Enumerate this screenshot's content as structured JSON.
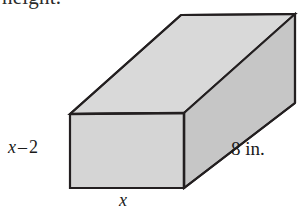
{
  "figure": {
    "kind": "rectangular-prism",
    "cutoff_text_top": "height.",
    "labels": {
      "height_left": {
        "variable": "x",
        "operator": "–",
        "value": "2",
        "full": "x – 2"
      },
      "width_bottom": "x",
      "depth_right": "8 in."
    },
    "colors": {
      "background": "#ffffff",
      "front_face": "#d5d5d5",
      "top_face": "#d9d9d9",
      "right_face": "#c6c6c6",
      "edge_stroke": "#231f20",
      "text": "#1a1a1a"
    },
    "geometry": {
      "front_face": {
        "top_left": [
          70,
          114
        ],
        "top_right": [
          184,
          113
        ],
        "bottom_right": [
          184,
          188
        ],
        "bottom_left": [
          70,
          188
        ]
      },
      "depth_offset": [
        111,
        -99
      ],
      "back_top_left": [
        181,
        15
      ],
      "back_top_right": [
        295,
        14
      ],
      "back_bottom_right": [
        295,
        103
      ]
    }
  }
}
